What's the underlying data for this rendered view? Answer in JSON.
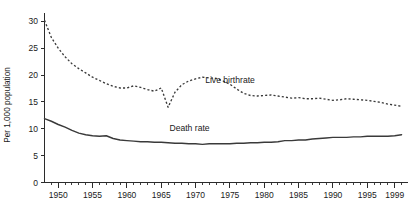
{
  "chart_data": {
    "type": "line",
    "title": "",
    "xlabel": "",
    "ylabel": "Per 1,000 population",
    "xlim": [
      1948,
      2000.5
    ],
    "ylim": [
      0,
      31
    ],
    "grid": false,
    "legend_position": "inline-annotations",
    "y_ticks": [
      0,
      5,
      10,
      15,
      20,
      25,
      30
    ],
    "y_tick_labels": [
      "0",
      "5",
      "10",
      "15",
      "20",
      "25",
      "30"
    ],
    "x_ticks": [
      1950,
      1955,
      1960,
      1965,
      1970,
      1975,
      1980,
      1985,
      1990,
      1995,
      1999
    ],
    "x_tick_labels": [
      "1950",
      "1955",
      "1960",
      "1965",
      "1970",
      "1975",
      "1980",
      "1985",
      "1990",
      "1995",
      "1999"
    ],
    "x_minor_tick_step": 1,
    "colors": {
      "axis": "#2b2b2b",
      "birthrate_line": "#3a3a3a",
      "deathrate_line": "#3a3a3a",
      "background": "#ffffff"
    },
    "series": [
      {
        "name": "Live birthrate",
        "style": "dashed",
        "annotation": "Live birthrate",
        "annotation_at": {
          "x": 1971.4,
          "y": 18.6
        },
        "x": [
          1948,
          1949,
          1950,
          1951,
          1952,
          1953,
          1954,
          1955,
          1956,
          1957,
          1958,
          1959,
          1960,
          1961,
          1962,
          1963,
          1964,
          1965,
          1966,
          1967,
          1968,
          1969,
          1970,
          1971,
          1972,
          1973,
          1974,
          1975,
          1976,
          1977,
          1978,
          1979,
          1980,
          1981,
          1982,
          1983,
          1984,
          1985,
          1986,
          1987,
          1988,
          1989,
          1990,
          1991,
          1992,
          1993,
          1994,
          1995,
          1996,
          1997,
          1998,
          1999,
          2000
        ],
        "values": [
          30.2,
          27.0,
          25.0,
          23.4,
          22.1,
          21.2,
          20.4,
          19.6,
          19.0,
          18.4,
          17.9,
          17.6,
          17.6,
          18.0,
          17.7,
          17.3,
          17.0,
          17.6,
          14.0,
          16.8,
          18.2,
          18.9,
          19.3,
          19.6,
          19.5,
          19.4,
          18.9,
          18.3,
          17.4,
          16.6,
          16.2,
          16.1,
          16.2,
          16.3,
          16.1,
          15.9,
          15.7,
          15.8,
          15.6,
          15.6,
          15.7,
          15.5,
          15.3,
          15.4,
          15.6,
          15.5,
          15.4,
          15.3,
          15.1,
          14.9,
          14.6,
          14.4,
          14.2
        ]
      },
      {
        "name": "Death rate",
        "style": "solid",
        "annotation": "Death rate",
        "annotation_at": {
          "x": 1966.2,
          "y": 9.6
        },
        "x": [
          1948,
          1949,
          1950,
          1951,
          1952,
          1953,
          1954,
          1955,
          1956,
          1957,
          1958,
          1959,
          1960,
          1961,
          1962,
          1963,
          1964,
          1965,
          1966,
          1967,
          1968,
          1969,
          1970,
          1971,
          1972,
          1973,
          1974,
          1975,
          1976,
          1977,
          1978,
          1979,
          1980,
          1981,
          1982,
          1983,
          1984,
          1985,
          1986,
          1987,
          1988,
          1989,
          1990,
          1991,
          1992,
          1993,
          1994,
          1995,
          1996,
          1997,
          1998,
          1999,
          2000
        ],
        "values": [
          11.9,
          11.4,
          10.8,
          10.3,
          9.7,
          9.2,
          8.9,
          8.7,
          8.6,
          8.7,
          8.2,
          7.9,
          7.8,
          7.7,
          7.6,
          7.6,
          7.5,
          7.5,
          7.4,
          7.3,
          7.3,
          7.2,
          7.2,
          7.1,
          7.2,
          7.2,
          7.2,
          7.2,
          7.3,
          7.3,
          7.4,
          7.4,
          7.5,
          7.5,
          7.6,
          7.8,
          7.8,
          7.9,
          7.9,
          8.1,
          8.2,
          8.3,
          8.4,
          8.4,
          8.4,
          8.5,
          8.5,
          8.6,
          8.6,
          8.6,
          8.6,
          8.7,
          8.9
        ]
      }
    ]
  }
}
